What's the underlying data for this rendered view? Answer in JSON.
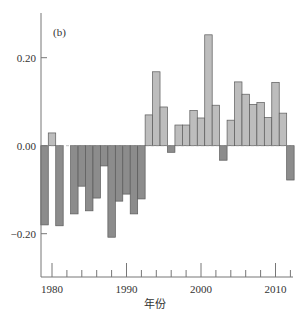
{
  "chart_data": {
    "type": "bar",
    "title": "",
    "panel_label": "(b)",
    "xlabel": "年份",
    "ylabel": "",
    "x": [
      1979,
      1980,
      1981,
      1982,
      1983,
      1984,
      1985,
      1986,
      1987,
      1988,
      1989,
      1990,
      1991,
      1992,
      1993,
      1994,
      1995,
      1996,
      1997,
      1998,
      1999,
      2000,
      2001,
      2002,
      2003,
      2004,
      2005,
      2006,
      2007,
      2008,
      2009,
      2010,
      2011,
      2012
    ],
    "values": [
      -0.18,
      0.029,
      -0.182,
      null,
      -0.155,
      -0.092,
      -0.148,
      -0.119,
      -0.046,
      -0.208,
      -0.126,
      -0.11,
      -0.155,
      -0.121,
      0.07,
      0.168,
      0.088,
      -0.015,
      0.047,
      0.047,
      0.08,
      0.063,
      0.252,
      0.092,
      -0.033,
      0.058,
      0.145,
      0.117,
      0.094,
      0.098,
      0.064,
      0.144,
      0.074,
      -0.078
    ],
    "ylim": [
      -0.3,
      0.3
    ],
    "xlim": [
      1978.5,
      2012.5
    ],
    "y_ticks": [
      {
        "value": 0.2,
        "label": "0.20"
      },
      {
        "value": 0.0,
        "label": "0.00"
      },
      {
        "value": -0.2,
        "label": "-0.20"
      }
    ],
    "x_major_ticks": [
      {
        "value": 1980,
        "label": "1980"
      },
      {
        "value": 1990,
        "label": "1990"
      },
      {
        "value": 2000,
        "label": "2000"
      },
      {
        "value": 2010,
        "label": "2010"
      }
    ],
    "x_minor_ticks": [
      1982,
      1984,
      1986,
      1988,
      1992,
      1994,
      1996,
      1998,
      2002,
      2004,
      2006,
      2008,
      2012
    ],
    "grid": false,
    "legend": null,
    "colors": {
      "positive_fill": "#bdbdbd",
      "negative_fill": "#8c8c8c",
      "bar_stroke": "#5a5a5a",
      "axis": "#777777",
      "zero_line": "#999999"
    }
  }
}
